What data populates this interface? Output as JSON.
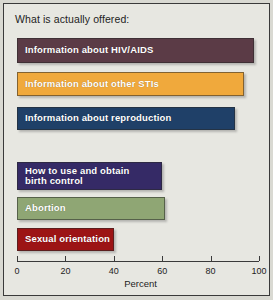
{
  "chart_data": {
    "type": "bar",
    "orientation": "horizontal",
    "title": "What is actually offered:",
    "xlabel": "Percent",
    "ylabel": "",
    "xlim": [
      0,
      100
    ],
    "xticks": [
      0,
      20,
      40,
      60,
      80,
      100
    ],
    "grid": false,
    "legend": "none",
    "categories": [
      "Information about HIV/AIDS",
      "Information about other STIs",
      "Information about reproduction",
      "How to use and obtain\nbirth control",
      "Abortion",
      "Sexual orientation"
    ],
    "values": [
      98,
      94,
      90,
      60,
      61,
      40
    ],
    "bar_colors": [
      "#5b3b46",
      "#f0a93c",
      "#1f4068",
      "#352a66",
      "#8fa674",
      "#9c1415"
    ],
    "label_color": "#ffffff",
    "background_color": "#e7e7e1",
    "axis_color": "#3a3a3a"
  }
}
